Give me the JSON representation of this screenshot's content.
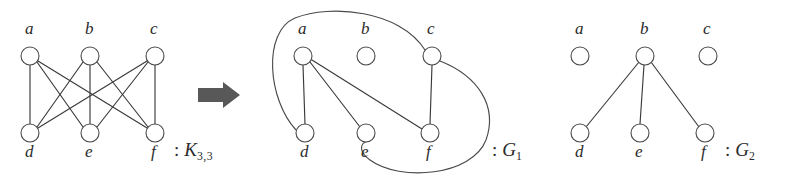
{
  "figure": {
    "width": 786,
    "height": 182,
    "background_color": "#ffffff",
    "edge_color": "#3a3a3a",
    "node_stroke_color": "#4a4a4a",
    "node_fill_color": "#ffffff",
    "label_color": "#2b2b2b",
    "arrow_color": "#585858"
  },
  "graphs": [
    {
      "id": "k33",
      "caption_colon": ":",
      "caption_name": "K",
      "caption_sub": "3,3",
      "caption_full": ": K3,3",
      "vertices": [
        {
          "label": "a",
          "x": 30,
          "y": 56,
          "r": 9,
          "label_x": 25,
          "label_y": 28
        },
        {
          "label": "b",
          "x": 90,
          "y": 56,
          "r": 9,
          "label_x": 85,
          "label_y": 28
        },
        {
          "label": "c",
          "x": 155,
          "y": 56,
          "r": 9,
          "label_x": 150,
          "label_y": 28
        },
        {
          "label": "d",
          "x": 30,
          "y": 133,
          "r": 9,
          "label_x": 25,
          "label_y": 148
        },
        {
          "label": "e",
          "x": 90,
          "y": 133,
          "r": 9,
          "label_x": 85,
          "label_y": 148
        },
        {
          "label": "f",
          "x": 155,
          "y": 133,
          "r": 9,
          "label_x": 151,
          "label_y": 148
        }
      ],
      "edges": [
        [
          "a",
          "d"
        ],
        [
          "a",
          "e"
        ],
        [
          "a",
          "f"
        ],
        [
          "b",
          "d"
        ],
        [
          "b",
          "e"
        ],
        [
          "b",
          "f"
        ],
        [
          "c",
          "d"
        ],
        [
          "c",
          "e"
        ],
        [
          "c",
          "f"
        ]
      ],
      "caption_x": 177,
      "caption_y": 147
    },
    {
      "id": "g1",
      "caption_colon": ":",
      "caption_name": "G",
      "caption_sub": "1",
      "caption_full": ": G1",
      "vertices": [
        {
          "label": "a",
          "x": 303,
          "y": 56,
          "r": 9,
          "label_x": 298,
          "label_y": 28
        },
        {
          "label": "b",
          "x": 366,
          "y": 56,
          "r": 9,
          "label_x": 361,
          "label_y": 28
        },
        {
          "label": "c",
          "x": 432,
          "y": 56,
          "r": 9,
          "label_x": 427,
          "label_y": 28
        },
        {
          "label": "d",
          "x": 305,
          "y": 133,
          "r": 9,
          "label_x": 300,
          "label_y": 148
        },
        {
          "label": "e",
          "x": 366,
          "y": 133,
          "r": 9,
          "label_x": 361,
          "label_y": 148
        },
        {
          "label": "f",
          "x": 430,
          "y": 133,
          "r": 9,
          "label_x": 426,
          "label_y": 148
        }
      ],
      "edges": [
        [
          "a",
          "d"
        ],
        [
          "a",
          "e"
        ],
        [
          "a",
          "f"
        ],
        [
          "c",
          "f"
        ],
        [
          "c",
          "d"
        ],
        [
          "c",
          "e"
        ]
      ],
      "isolated_vertices": [
        "b"
      ],
      "caption_x": 492,
      "caption_y": 147
    },
    {
      "id": "g2",
      "caption_colon": ":",
      "caption_name": "G",
      "caption_sub": "2",
      "caption_full": ": G2",
      "vertices": [
        {
          "label": "a",
          "x": 580,
          "y": 56,
          "r": 9,
          "label_x": 575,
          "label_y": 28
        },
        {
          "label": "b",
          "x": 645,
          "y": 56,
          "r": 9,
          "label_x": 640,
          "label_y": 28
        },
        {
          "label": "c",
          "x": 708,
          "y": 56,
          "r": 9,
          "label_x": 703,
          "label_y": 28
        },
        {
          "label": "d",
          "x": 580,
          "y": 133,
          "r": 9,
          "label_x": 575,
          "label_y": 148
        },
        {
          "label": "e",
          "x": 640,
          "y": 133,
          "r": 9,
          "label_x": 635,
          "label_y": 148
        },
        {
          "label": "f",
          "x": 705,
          "y": 133,
          "r": 9,
          "label_x": 701,
          "label_y": 148
        }
      ],
      "edges": [
        [
          "b",
          "d"
        ],
        [
          "b",
          "e"
        ],
        [
          "b",
          "f"
        ]
      ],
      "isolated_vertices": [
        "a",
        "c"
      ],
      "caption_x": 727,
      "caption_y": 147
    }
  ],
  "arrow": {
    "name": "transformation-arrow",
    "direction": "right",
    "x": 198,
    "y": 82,
    "width": 42,
    "height": 26
  }
}
